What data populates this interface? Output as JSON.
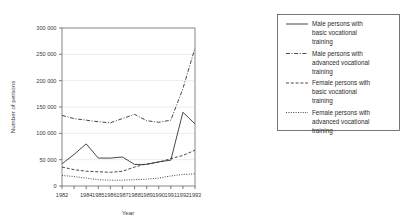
{
  "chart_data": {
    "type": "line",
    "title": "",
    "xlabel": "Year",
    "ylabel": "Number of persons",
    "grid": true,
    "legend_position": "right",
    "xlim": [
      1982,
      1993
    ],
    "ylim": [
      0,
      300000
    ],
    "yticks": [
      0,
      50000,
      100000,
      150000,
      200000,
      250000,
      300000
    ],
    "ytick_labels": [
      "0",
      "50 000",
      "100 000",
      "150 000",
      "200 000",
      "250 000",
      "300 000"
    ],
    "x": [
      1982,
      1983,
      1984,
      1985,
      1986,
      1987,
      1988,
      1989,
      1990,
      1991,
      1992,
      1993
    ],
    "xtick_labels": [
      "1982",
      "",
      "1984",
      "1985",
      "1986",
      "1987",
      "1988",
      "1989",
      "1990",
      "1991",
      "1992",
      "1993"
    ],
    "series": [
      {
        "name": "Male persons with basic vocational training",
        "style": "solid",
        "values": [
          42000,
          60000,
          80000,
          53000,
          53000,
          55000,
          41000,
          41000,
          46000,
          49000,
          140000,
          118000
        ]
      },
      {
        "name": "Male persons with advanced vocational training",
        "style": "dashdot",
        "values": [
          134000,
          128000,
          125000,
          122000,
          120000,
          128000,
          136000,
          124000,
          121000,
          125000,
          185000,
          262000
        ]
      },
      {
        "name": "Female persons with basic vocational training",
        "style": "dashed",
        "values": [
          36000,
          31000,
          28000,
          27000,
          26000,
          28000,
          36000,
          42000,
          45000,
          52000,
          58000,
          68000
        ]
      },
      {
        "name": "Female persons with advanced vocational training",
        "style": "dotted",
        "values": [
          20000,
          18000,
          15000,
          12000,
          11000,
          11000,
          12000,
          13000,
          15000,
          19000,
          22000,
          23000
        ]
      }
    ]
  },
  "axes": {
    "ylabel": "Number of persons",
    "xlabel": "Year",
    "ytick_labels": [
      "300 000",
      "250 000",
      "200 000",
      "150 000",
      "100 000",
      "50 000",
      "0"
    ],
    "xtick_labels": [
      "1982",
      "1984",
      "1985",
      "1986",
      "1987",
      "1988",
      "1989",
      "1990",
      "1991",
      "1992",
      "1993"
    ]
  },
  "legend": {
    "entries": [
      {
        "line1": "Male persons with",
        "line2": "basic vocational",
        "line3": "training",
        "style": "solid"
      },
      {
        "line1": "Male persons with",
        "line2": "advanced vocational",
        "line3": "training",
        "style": "dashdot"
      },
      {
        "line1": "Female persons with",
        "line2": "basic vocational",
        "line3": "training",
        "style": "dashed"
      },
      {
        "line1": "Female persons with",
        "line2": "advanced vocational",
        "line3": "training",
        "style": "dotted"
      }
    ]
  },
  "colors": {
    "line": "#333333",
    "frame": "#6a6a6a",
    "grid": "#d8d8d8",
    "text": "#2b2b2b",
    "background": "#ffffff"
  }
}
